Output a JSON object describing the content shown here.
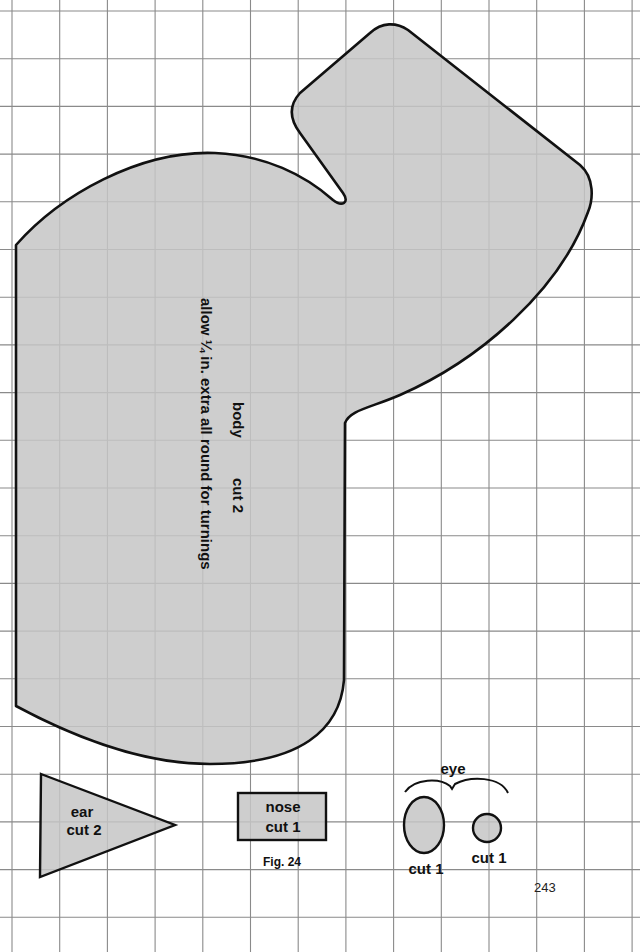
{
  "grid": {
    "line_color": "#8a8a8a",
    "origin_x": 12,
    "origin_y": 11,
    "spacing": 47.7,
    "cols": 14,
    "rows": 20
  },
  "colors": {
    "piece_fill": "#c6c6c6",
    "outline": "#111111",
    "background": "#ffffff"
  },
  "pieces": {
    "body": {
      "label": "body",
      "cut": "cut 2",
      "note": "allow ¼ in. extra all round for turnings"
    },
    "ear": {
      "label": "ear",
      "cut": "cut 2"
    },
    "nose": {
      "label": "nose",
      "cut": "cut 1"
    },
    "eye": {
      "label": "eye",
      "large_cut": "cut 1",
      "small_cut": "cut 1"
    }
  },
  "figure_caption": "Fig. 24",
  "page_number": "243"
}
